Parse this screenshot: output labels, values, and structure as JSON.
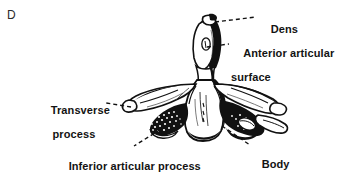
{
  "figure": {
    "panel_letter": "D",
    "background_color": "#ffffff",
    "ink_color": "#000000",
    "text_color": "#131313",
    "width": 351,
    "height": 179
  },
  "labels": {
    "dens": "Dens",
    "anterior_articular_surface_line1": "Anterior articular",
    "anterior_articular_surface_line2": "surface",
    "transverse_process_line1": "Transverse",
    "transverse_process_line2": "process",
    "inferior_articular_process": "Inferior articular process",
    "body": "Body"
  },
  "leaders": [
    {
      "name": "leader-dens",
      "from": [
        215,
        22
      ],
      "to": [
        256,
        17
      ]
    },
    {
      "name": "leader-aas",
      "from": [
        207,
        47
      ],
      "to": [
        229,
        44
      ]
    },
    {
      "name": "leader-tp",
      "from": [
        131,
        107
      ],
      "to": [
        106,
        103
      ]
    },
    {
      "name": "leader-iap",
      "from": [
        166,
        126
      ],
      "to": [
        134,
        146
      ]
    },
    {
      "name": "leader-body",
      "from": [
        222,
        126
      ],
      "to": [
        250,
        145
      ]
    }
  ],
  "structures": [
    "dens",
    "anterior articular surface",
    "transverse process",
    "inferior articular process",
    "body"
  ]
}
